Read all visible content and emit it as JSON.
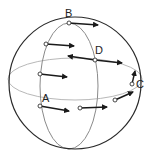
{
  "diagram": {
    "colors": {
      "outline": "#2a2a2a",
      "meridian": "#8a8a8a",
      "equator": "#b8b8b8",
      "arrow": "#1a1a1a",
      "point_fill": "#ffffff"
    },
    "labels": {
      "A": "A",
      "B": "B",
      "C": "C",
      "D": "D"
    },
    "points": [
      {
        "id": "B",
        "x": 69,
        "y": 23,
        "arrow_to": [
          98,
          25
        ]
      },
      {
        "id": "p1",
        "x": 46,
        "y": 44,
        "arrow_to": [
          74,
          46
        ]
      },
      {
        "id": "D",
        "x": 95,
        "y": 60,
        "arrow_to": [
          122,
          63
        ],
        "arrow2_to": [
          68,
          56
        ]
      },
      {
        "id": "p2",
        "x": 40,
        "y": 74,
        "arrow_to": [
          67,
          77
        ]
      },
      {
        "id": "A",
        "x": 40,
        "y": 106,
        "arrow_to": [
          69,
          111
        ]
      },
      {
        "id": "p3",
        "x": 80,
        "y": 108,
        "arrow_to": [
          107,
          107
        ]
      },
      {
        "id": "p4",
        "x": 115,
        "y": 100,
        "arrow_to": [
          133,
          92
        ]
      },
      {
        "id": "C",
        "x": 132,
        "y": 84,
        "arrow_to": [
          135,
          71
        ]
      }
    ]
  }
}
